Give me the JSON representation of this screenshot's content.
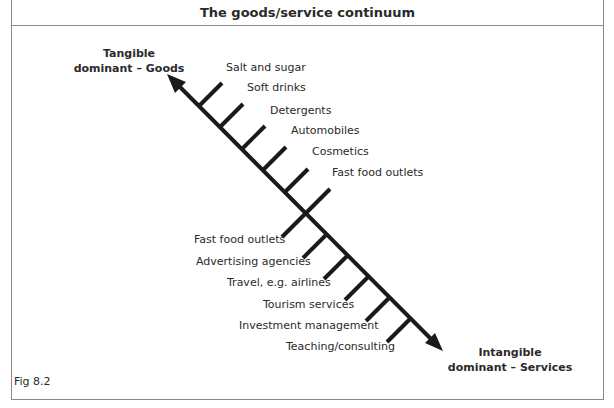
{
  "title": "The goods/service continuum",
  "figure_label": "Fig 8.2",
  "poles": {
    "top_left": {
      "line1": "Tangible",
      "line2": "dominant – Goods"
    },
    "bottom_right": {
      "line1": "Intangible",
      "line2": "dominant – Services"
    }
  },
  "goods_items": [
    "Salt and sugar",
    "Soft drinks",
    "Detergents",
    "Automobiles",
    "Cosmetics",
    "Fast food outlets"
  ],
  "service_items": [
    "Fast food outlets",
    "Advertising agencies",
    "Travel, e.g. airlines",
    "Tourism services",
    "Investment management",
    "Teaching/consulting"
  ],
  "colors": {
    "line": "#1a1a1a",
    "border": "#8a8a8a",
    "text": "#2a2a2a"
  }
}
